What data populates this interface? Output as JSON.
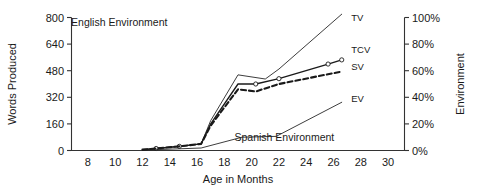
{
  "chart_data": {
    "type": "line",
    "title": "",
    "xlabel": "Age in Months",
    "ylabel": "Words Produced",
    "y2label": "Environment",
    "xlim": [
      6.8,
      31.2
    ],
    "ylim": [
      0,
      800
    ],
    "y2lim": [
      0,
      100
    ],
    "grid": false,
    "legend_position": "inline-right-of-line-ends",
    "xticks": [
      "8",
      "10",
      "12",
      "14",
      "16",
      "18",
      "20",
      "22",
      "24",
      "26",
      "28",
      "30"
    ],
    "xtick_values": [
      8,
      10,
      12,
      14,
      16,
      18,
      20,
      22,
      24,
      26,
      28,
      30
    ],
    "yticks": [
      "0",
      "160",
      "320",
      "480",
      "640",
      "800"
    ],
    "ytick_values": [
      0,
      160,
      320,
      480,
      640,
      800
    ],
    "y2ticks": [
      "0%",
      "20%",
      "40%",
      "60%",
      "80%",
      "100%"
    ],
    "y2tick_values": [
      0,
      20,
      40,
      60,
      80,
      100
    ],
    "annotations": [
      {
        "name": "english-environment-annotation",
        "text": "English Environment",
        "x": 10.3,
        "y": 775
      },
      {
        "name": "spanish-environment-annotation",
        "text": "Spanish Environment",
        "x": 22.4,
        "y": 82
      }
    ],
    "series": [
      {
        "name": "TV",
        "label": "TV",
        "style": "solid-thin",
        "markers": false,
        "label_x": 27.3,
        "label_y": 800,
        "x": [
          12.0,
          13.0,
          14.7,
          16.3,
          17.0,
          19.0,
          21.0,
          22.0,
          26.6
        ],
        "values": [
          5,
          12,
          25,
          40,
          180,
          455,
          430,
          490,
          820
        ]
      },
      {
        "name": "TCV",
        "label": "TCV",
        "style": "solid",
        "markers": true,
        "label_x": 27.3,
        "label_y": 610,
        "x": [
          12.0,
          13.0,
          14.7,
          16.3,
          17.0,
          19.0,
          20.3,
          22.0,
          25.6,
          26.6
        ],
        "values": [
          5,
          12,
          25,
          40,
          160,
          400,
          400,
          432,
          520,
          545
        ]
      },
      {
        "name": "SV",
        "label": "SV",
        "style": "dashed",
        "markers": false,
        "label_x": 27.3,
        "label_y": 505,
        "x": [
          12.0,
          13.0,
          14.7,
          16.3,
          17.0,
          19.0,
          20.3,
          22.0,
          26.6
        ],
        "values": [
          5,
          12,
          25,
          40,
          150,
          368,
          355,
          400,
          475
        ]
      },
      {
        "name": "EV",
        "label": "EV",
        "style": "solid-thin",
        "markers": false,
        "label_x": 27.3,
        "label_y": 310,
        "x": [
          12.0,
          16.3,
          19.3,
          21.8,
          26.6
        ],
        "values": [
          2,
          15,
          80,
          85,
          290
        ]
      }
    ]
  },
  "axes": {
    "left_title": "Words Produced",
    "right_title": "Environment",
    "bottom_title": "Age in Months"
  }
}
